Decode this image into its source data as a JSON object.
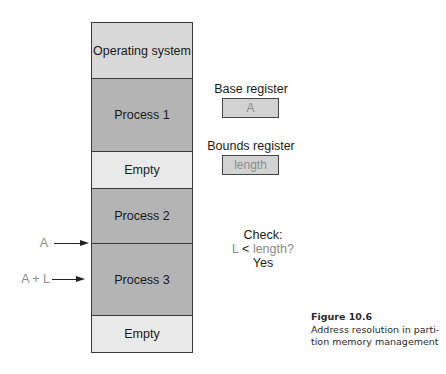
{
  "memory": {
    "segments": [
      {
        "label": "Operating system",
        "type": "os"
      },
      {
        "label": "Process 1",
        "type": "process"
      },
      {
        "label": "Empty",
        "type": "empty"
      },
      {
        "label": "Process 2",
        "type": "process"
      },
      {
        "label": "Process 3",
        "type": "process"
      },
      {
        "label": "Empty",
        "type": "empty"
      }
    ]
  },
  "pointers": {
    "a": "A",
    "a_plus_l": "A + L"
  },
  "registers": {
    "base": {
      "label": "Base register",
      "value": "A"
    },
    "bounds": {
      "label": "Bounds register",
      "value": "length"
    }
  },
  "check": {
    "title": "Check:",
    "lhs": "L",
    "op": "<",
    "rhs": "length?",
    "result": "Yes"
  },
  "caption": {
    "figure": "Figure 10.6",
    "line1": "Address resolution in parti-",
    "line2": "tion memory management"
  },
  "colors": {
    "os": "#d8d8d8",
    "process": "#b4b4b4",
    "empty": "#e9e9e9",
    "register": "#d2d2d2"
  }
}
